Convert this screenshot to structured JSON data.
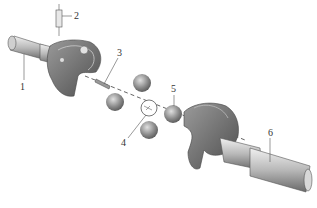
{
  "diagram": {
    "type": "exploded-assembly",
    "labels": [
      {
        "id": "1",
        "text": "1",
        "part": "drive shaft yoke"
      },
      {
        "id": "2",
        "text": "2",
        "part": "locating pin"
      },
      {
        "id": "3",
        "text": "3",
        "part": "center ball pin"
      },
      {
        "id": "4",
        "text": "4",
        "part": "center ball"
      },
      {
        "id": "5",
        "text": "5",
        "part": "drive ball"
      },
      {
        "id": "6",
        "text": "6",
        "part": "driven shaft yoke"
      }
    ],
    "colors": {
      "metal_dark": "#6e6e6e",
      "metal_mid": "#9a9a9a",
      "metal_light": "#d4d4d4",
      "line": "#444444"
    }
  }
}
